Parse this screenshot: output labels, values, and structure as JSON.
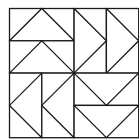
{
  "diagram": {
    "type": "quilt-block",
    "origin": [
      9.5,
      8.5
    ],
    "unit": 32.3,
    "stroke": "#1a1a1a",
    "stroke_width": 1.3,
    "background": "#ffffff",
    "rectangles": [
      {
        "name": "tl-top",
        "x": 0,
        "y": 0,
        "w": 2,
        "h": 1
      },
      {
        "name": "tl-bottom",
        "x": 0,
        "y": 1,
        "w": 2,
        "h": 1
      },
      {
        "name": "tr-left",
        "x": 2,
        "y": 0,
        "w": 1,
        "h": 2
      },
      {
        "name": "tr-right",
        "x": 3,
        "y": 0,
        "w": 1,
        "h": 2
      },
      {
        "name": "bl-left",
        "x": 0,
        "y": 2,
        "w": 1,
        "h": 2
      },
      {
        "name": "bl-right",
        "x": 1,
        "y": 2,
        "w": 1,
        "h": 2
      },
      {
        "name": "br-top",
        "x": 2,
        "y": 2,
        "w": 2,
        "h": 1
      },
      {
        "name": "br-bottom",
        "x": 2,
        "y": 3,
        "w": 2,
        "h": 1
      }
    ],
    "triangles": [
      {
        "name": "tl-top-up",
        "points": [
          [
            0,
            1
          ],
          [
            1,
            0
          ],
          [
            2,
            1
          ]
        ]
      },
      {
        "name": "tl-bottom-up",
        "points": [
          [
            0,
            2
          ],
          [
            1,
            1
          ],
          [
            2,
            2
          ]
        ]
      },
      {
        "name": "tr-left-right",
        "points": [
          [
            2,
            0
          ],
          [
            3,
            1
          ],
          [
            2,
            2
          ]
        ]
      },
      {
        "name": "tr-right-right",
        "points": [
          [
            3,
            0
          ],
          [
            4,
            1
          ],
          [
            3,
            2
          ]
        ]
      },
      {
        "name": "bl-left-left",
        "points": [
          [
            1,
            2
          ],
          [
            0,
            3
          ],
          [
            1,
            4
          ]
        ]
      },
      {
        "name": "bl-right-left",
        "points": [
          [
            2,
            2
          ],
          [
            1,
            3
          ],
          [
            2,
            4
          ]
        ]
      },
      {
        "name": "br-top-down",
        "points": [
          [
            2,
            2
          ],
          [
            3,
            3
          ],
          [
            4,
            2
          ]
        ]
      },
      {
        "name": "br-bottom-down",
        "points": [
          [
            2,
            3
          ],
          [
            3,
            4
          ],
          [
            4,
            3
          ]
        ]
      }
    ]
  }
}
